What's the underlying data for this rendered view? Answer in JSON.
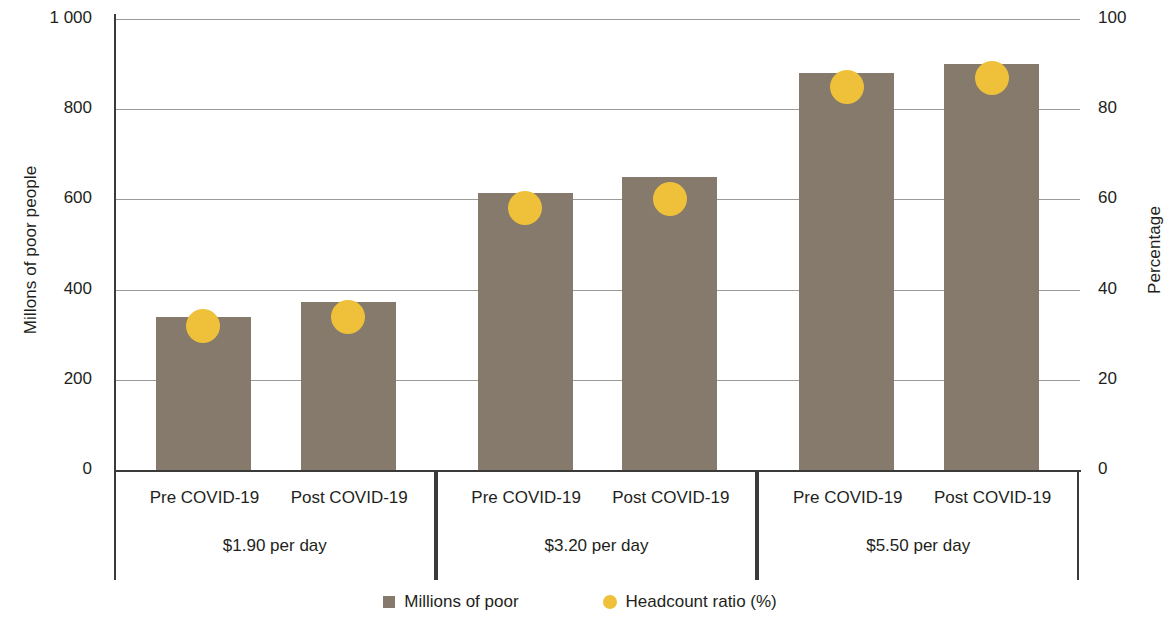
{
  "chart_data": {
    "type": "bar",
    "title": "",
    "xlabel": "",
    "ylabel": "Millons of poor people",
    "y2label": "Percentage",
    "ylim": [
      0,
      1000
    ],
    "y2lim": [
      0,
      100
    ],
    "grid": true,
    "legend_position": "bottom",
    "y_ticks": [
      "0",
      "200",
      "400",
      "600",
      "800",
      "1 000"
    ],
    "y_tick_values": [
      0,
      200,
      400,
      600,
      800,
      1000
    ],
    "y2_ticks": [
      "0",
      "20",
      "40",
      "60",
      "80",
      "100"
    ],
    "y2_tick_values": [
      0,
      20,
      40,
      60,
      80,
      100
    ],
    "categories": [
      "Pre COVID-19",
      "Post COVID-19",
      "Pre COVID-19",
      "Post COVID-19",
      "Pre COVID-19",
      "Post COVID-19"
    ],
    "groups": [
      {
        "label": "$1.90 per day",
        "categories": [
          "Pre COVID-19",
          "Post COVID-19"
        ]
      },
      {
        "label": "$3.20 per day",
        "categories": [
          "Pre COVID-19",
          "Post COVID-19"
        ]
      },
      {
        "label": "$5.50 per day",
        "categories": [
          "Pre COVID-19",
          "Post COVID-19"
        ]
      }
    ],
    "series": [
      {
        "name": "Millions of poor",
        "type": "bar",
        "axis": "left",
        "color": "#857a6b",
        "values": [
          340,
          372,
          615,
          650,
          880,
          900
        ]
      },
      {
        "name": "Headcount ratio (%)",
        "type": "scatter",
        "axis": "right",
        "color": "#efc13a",
        "values": [
          32,
          34,
          58,
          60,
          85,
          87
        ]
      }
    ],
    "legend": [
      {
        "label": "Millions of poor",
        "marker": "square",
        "color": "#857a6b"
      },
      {
        "label": "Headcount ratio (%)",
        "marker": "circle",
        "color": "#efc13a"
      }
    ]
  },
  "axes": {
    "left_title": "Millons of poor people",
    "right_title": "Percentage"
  },
  "colors": {
    "bar": "#857a6b",
    "dot": "#efc13a",
    "axis": "#3a3a38",
    "grid": "#9a9a96",
    "text": "#231f20",
    "background": "#ffffff"
  }
}
